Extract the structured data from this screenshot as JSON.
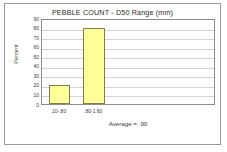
{
  "frame": {
    "border_color": "#9a9a9a",
    "background": "#ffffff"
  },
  "chart_data": {
    "type": "bar",
    "title": "PEBBLE COUNT  -  D50 Range  (mm)",
    "xlabel": "",
    "ylabel": "Percent",
    "categories": [
      ".10-.80",
      ".80-1.60"
    ],
    "values": [
      20,
      80
    ],
    "ylim": [
      0,
      90
    ],
    "yticks": [
      0,
      10,
      20,
      30,
      40,
      50,
      60,
      70,
      80,
      90
    ],
    "ytick_labels": [
      "0",
      "10",
      "20",
      "30",
      "40",
      "50",
      "60",
      "70",
      "80",
      "90"
    ],
    "grid": true,
    "grid_axis": "y",
    "legend": null,
    "annotation": "Average =  .90",
    "bar_color": "#ffff99",
    "bar_edge_color": "#7d7d50",
    "plot_bg": "#ffffff",
    "axis_color": "#8d8d8d",
    "gridline_color": "#d2d2d2",
    "n_slots": 5,
    "bar_slot_indices": [
      0,
      1
    ]
  }
}
